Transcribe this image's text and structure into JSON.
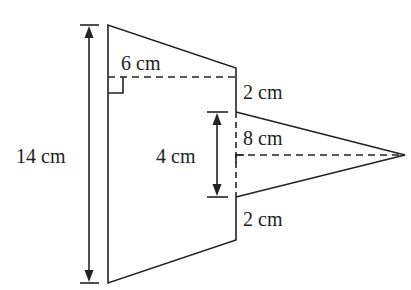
{
  "diagram": {
    "type": "composite-shape",
    "colors": {
      "stroke": "#222222",
      "background": "#ffffff"
    },
    "labels": {
      "total_height": "14 cm",
      "top_offset_width": "6 cm",
      "upper_gap": "2 cm",
      "triangle_height": "8 cm",
      "triangle_base": "4 cm",
      "lower_gap": "2 cm"
    }
  }
}
